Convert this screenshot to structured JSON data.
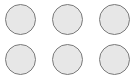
{
  "grid": {
    "rows": 2,
    "columns": 3,
    "colors": {
      "background": "#ffffff",
      "circle_fill": "#e7e7e7",
      "circle_border": "#7a7a7a"
    },
    "items": [
      {
        "row": 1,
        "col": 1,
        "icon": "circle-icon"
      },
      {
        "row": 1,
        "col": 2,
        "icon": "circle-icon"
      },
      {
        "row": 1,
        "col": 3,
        "icon": "circle-icon"
      },
      {
        "row": 2,
        "col": 1,
        "icon": "circle-icon"
      },
      {
        "row": 2,
        "col": 2,
        "icon": "circle-icon"
      },
      {
        "row": 2,
        "col": 3,
        "icon": "circle-icon"
      }
    ]
  }
}
